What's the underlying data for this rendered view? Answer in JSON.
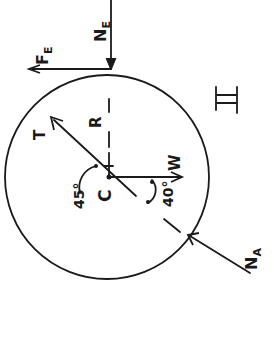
{
  "diagram": {
    "type": "free-body diagram",
    "body": "circle",
    "roman_numeral": "II",
    "labels": {
      "center": "C",
      "radius": "R",
      "tension": "T",
      "weight": "W",
      "normal_E": "N",
      "normal_E_sub": "E",
      "friction_E": "F",
      "friction_E_sub": "E",
      "normal_A": "N",
      "normal_A_sub": "A",
      "angle_T": "45°",
      "angle_NA": "40°"
    },
    "ink_color": "#1a1a1a",
    "background": "#ffffff"
  }
}
